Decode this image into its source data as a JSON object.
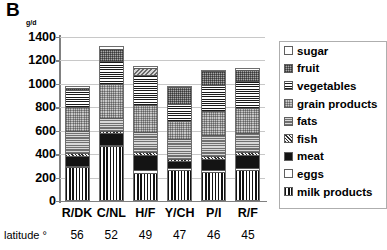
{
  "panel": {
    "title": "B",
    "unit": "g/d"
  },
  "axis": {
    "y_ticks": [
      0,
      200,
      400,
      600,
      800,
      1000,
      1200,
      1400
    ],
    "y_min": 0,
    "y_max": 1400,
    "latitude_label": "latitude °"
  },
  "legend": {
    "items": [
      {
        "label": "sugar",
        "key": "sugar",
        "pattern": "p-sugar"
      },
      {
        "label": "fruit",
        "key": "fruit",
        "pattern": "p-fruit"
      },
      {
        "label": "vegetables",
        "key": "veg",
        "pattern": "p-veg"
      },
      {
        "label": "grain products",
        "key": "grain",
        "pattern": "p-grain"
      },
      {
        "label": "fats",
        "key": "fats",
        "pattern": "p-fats"
      },
      {
        "label": "fish",
        "key": "fish",
        "pattern": "p-fish"
      },
      {
        "label": "meat",
        "key": "meat",
        "pattern": "p-meat"
      },
      {
        "label": "eggs",
        "key": "eggs",
        "pattern": "p-eggs"
      },
      {
        "label": "milk products",
        "key": "milk",
        "pattern": "p-milk"
      }
    ]
  },
  "chart_data": {
    "type": "bar",
    "stacked": true,
    "title": "B",
    "xlabel": "",
    "ylabel": "g/d",
    "ylim": [
      0,
      1400
    ],
    "ytick_step": 200,
    "grid": true,
    "legend_position": "right",
    "categories": [
      "R/DK",
      "C/NL",
      "H/F",
      "Y/CH",
      "P/I",
      "R/F"
    ],
    "latitudes": [
      56,
      52,
      49,
      47,
      46,
      45
    ],
    "series": [
      {
        "name": "milk products",
        "values": [
          270,
          450,
          225,
          245,
          230,
          245
        ]
      },
      {
        "name": "eggs",
        "values": [
          15,
          15,
          25,
          20,
          20,
          20
        ]
      },
      {
        "name": "meat",
        "values": [
          85,
          95,
          125,
          60,
          95,
          110
        ]
      },
      {
        "name": "fish",
        "values": [
          20,
          20,
          25,
          20,
          25,
          25
        ]
      },
      {
        "name": "fats",
        "values": [
          195,
          110,
          175,
          165,
          175,
          165
        ]
      },
      {
        "name": "grain products",
        "values": [
          205,
          290,
          225,
          160,
          210,
          215
        ]
      },
      {
        "name": "vegetables",
        "values": [
          140,
          195,
          255,
          145,
          220,
          230
        ]
      },
      {
        "name": "fruit",
        "values": [
          20,
          110,
          65,
          140,
          115,
          90
        ]
      },
      {
        "name": "sugar",
        "values": [
          15,
          25,
          20,
          10,
          15,
          20
        ]
      }
    ],
    "totals": [
      965,
      1310,
      1140,
      965,
      1105,
      1120
    ]
  }
}
